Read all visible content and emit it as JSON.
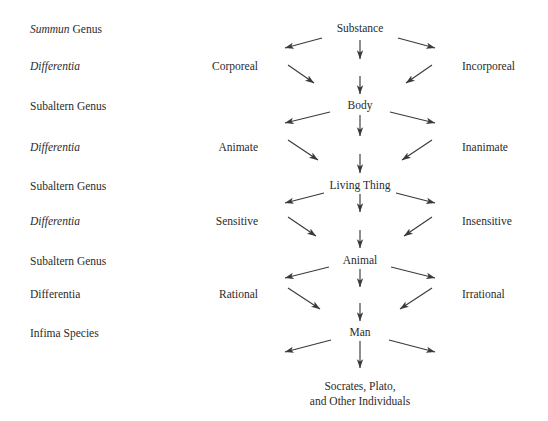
{
  "diagram": {
    "background_color": "#ffffff",
    "text_color": "#2b2b2b",
    "arrow_color": "#3a3a3a",
    "ranks": [
      {
        "italic_part": "Summun",
        "roman_part": " Genus",
        "y": 29
      },
      {
        "italic_part": "Differentia",
        "roman_part": "",
        "y": 66
      },
      {
        "italic_part": "",
        "roman_part": "Subaltern Genus",
        "y": 106
      },
      {
        "italic_part": "Differentia",
        "roman_part": "",
        "y": 147
      },
      {
        "italic_part": "",
        "roman_part": "Subaltern Genus",
        "y": 186
      },
      {
        "italic_part": "Differentia",
        "roman_part": "",
        "y": 221
      },
      {
        "italic_part": "",
        "roman_part": "Subaltern Genus",
        "y": 261
      },
      {
        "italic_part": "",
        "roman_part": "Differentia",
        "y": 294
      },
      {
        "italic_part": "",
        "roman_part": "Infima Species",
        "y": 333
      }
    ],
    "left_differentiae": [
      {
        "label": "Corporeal",
        "y": 66
      },
      {
        "label": "Animate",
        "y": 147
      },
      {
        "label": "Sensitive",
        "y": 221
      },
      {
        "label": "Rational",
        "y": 294
      }
    ],
    "right_differentiae": [
      {
        "label": "Incorporeal",
        "y": 66
      },
      {
        "label": "Inanimate",
        "y": 147
      },
      {
        "label": "Insensitive",
        "y": 221
      },
      {
        "label": "Irrational",
        "y": 294
      }
    ],
    "nodes": [
      {
        "label": "Substance",
        "y": 22
      },
      {
        "label": "Body",
        "y": 99
      },
      {
        "label": "Living Thing",
        "y": 179
      },
      {
        "label": "Animal",
        "y": 254
      },
      {
        "label": "Man",
        "y": 326
      }
    ],
    "terminal_node": {
      "line1": "Socrates, Plato,",
      "line2": "and Other Individuals",
      "y": 379
    }
  }
}
